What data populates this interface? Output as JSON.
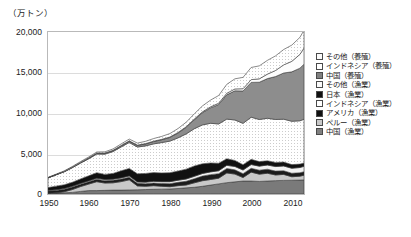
{
  "chart_data": {
    "type": "area",
    "title": "",
    "subtitle": "",
    "xlabel": "",
    "ylabel": "（万トン）",
    "unit_label": "（万トン）",
    "stacked": true,
    "grid": true,
    "legend_position": "right",
    "xlim": [
      1950,
      2013
    ],
    "ylim": [
      0,
      20000
    ],
    "yticks": [
      "0",
      "5,000",
      "10,000",
      "15,000",
      "20,000"
    ],
    "ytick_values": [
      0,
      5000,
      10000,
      15000,
      20000
    ],
    "xticks": [
      "1950",
      "1960",
      "1970",
      "1980",
      "1990",
      "2000",
      "2010"
    ],
    "xtick_values": [
      1950,
      1960,
      1970,
      1980,
      1990,
      2000,
      2010
    ],
    "x": [
      1950,
      1952,
      1954,
      1956,
      1958,
      1960,
      1962,
      1964,
      1966,
      1968,
      1970,
      1972,
      1974,
      1976,
      1978,
      1980,
      1982,
      1984,
      1986,
      1988,
      1990,
      1992,
      1994,
      1996,
      1998,
      2000,
      2002,
      2004,
      2006,
      2008,
      2010,
      2012,
      2013
    ],
    "series": [
      {
        "name": "中国（漁業）",
        "fill": "#7a7a7a",
        "pattern": "solid-gray",
        "values": [
          90,
          110,
          150,
          200,
          320,
          420,
          420,
          450,
          480,
          480,
          500,
          520,
          550,
          580,
          600,
          620,
          680,
          760,
          830,
          950,
          1100,
          1250,
          1400,
          1500,
          1600,
          1600,
          1550,
          1600,
          1650,
          1680,
          1700,
          1720,
          1740
        ]
      },
      {
        "name": "ペルー（漁業）",
        "fill": "#c9c9c9",
        "pattern": "light-gray",
        "values": [
          10,
          30,
          130,
          350,
          600,
          800,
          1100,
          900,
          900,
          1050,
          1250,
          480,
          400,
          450,
          350,
          280,
          350,
          350,
          550,
          690,
          690,
          700,
          1200,
          960,
          430,
          1100,
          900,
          960,
          700,
          740,
          430,
          480,
          580
        ]
      },
      {
        "name": "アメリカ（漁業）",
        "fill": "#1c1c1c",
        "pattern": "solid-black",
        "values": [
          290,
          300,
          310,
          310,
          290,
          290,
          310,
          300,
          310,
          310,
          320,
          320,
          320,
          330,
          350,
          380,
          410,
          460,
          500,
          570,
          600,
          560,
          550,
          520,
          480,
          470,
          490,
          500,
          480,
          450,
          430,
          420,
          430
        ]
      },
      {
        "name": "インドネシア（漁業）",
        "fill": "#f2f2f2",
        "pattern": "white",
        "values": [
          60,
          70,
          80,
          90,
          100,
          110,
          120,
          130,
          140,
          150,
          160,
          170,
          190,
          200,
          220,
          240,
          260,
          280,
          300,
          320,
          340,
          360,
          390,
          420,
          450,
          470,
          500,
          520,
          560,
          590,
          620,
          650,
          670
        ]
      },
      {
        "name": "日本（漁業）",
        "fill": "#111111",
        "pattern": "solid-black",
        "values": [
          340,
          460,
          470,
          500,
          550,
          620,
          680,
          640,
          710,
          870,
          930,
          1010,
          1080,
          1080,
          1080,
          1110,
          1130,
          1220,
          1280,
          1200,
          1100,
          930,
          810,
          740,
          660,
          640,
          560,
          520,
          510,
          480,
          450,
          420,
          410
        ]
      },
      {
        "name": "その他（漁業）",
        "fill": "#fbfbfb",
        "pattern": "dotted-light",
        "values": [
          1200,
          1400,
          1600,
          1800,
          1950,
          2100,
          2300,
          2500,
          2700,
          2950,
          3200,
          3300,
          3400,
          3550,
          3750,
          3900,
          4100,
          4350,
          4600,
          4800,
          4900,
          4850,
          4900,
          5000,
          5100,
          5200,
          5200,
          5250,
          5300,
          5300,
          5350,
          5350,
          5400
        ]
      },
      {
        "name": "中国（養殖）",
        "fill": "#8d8d8d",
        "pattern": "solid-gray",
        "values": [
          10,
          20,
          40,
          60,
          80,
          100,
          110,
          120,
          130,
          150,
          170,
          200,
          240,
          290,
          350,
          450,
          600,
          800,
          1100,
          1500,
          1900,
          2400,
          3000,
          3600,
          4000,
          4300,
          4600,
          4900,
          5300,
          5700,
          6100,
          6500,
          6800
        ]
      },
      {
        "name": "インドネシア（養殖）",
        "fill": "#fdfdfd",
        "pattern": "white",
        "values": [
          2,
          3,
          5,
          7,
          10,
          12,
          15,
          18,
          22,
          26,
          30,
          35,
          40,
          45,
          52,
          60,
          70,
          80,
          95,
          110,
          130,
          160,
          190,
          230,
          280,
          340,
          420,
          550,
          750,
          1000,
          1300,
          1700,
          2000
        ]
      },
      {
        "name": "その他（養殖）",
        "fill": "#f7f7f7",
        "pattern": "dotted-light",
        "values": [
          50,
          60,
          70,
          85,
          100,
          115,
          130,
          150,
          170,
          195,
          220,
          250,
          280,
          320,
          360,
          420,
          480,
          560,
          640,
          730,
          830,
          950,
          1100,
          1250,
          1400,
          1500,
          1600,
          1700,
          1800,
          1900,
          2000,
          2100,
          2200
        ]
      }
    ],
    "totals_note": "stacked total reaches about 19,500 by 2013"
  },
  "legend": {
    "items": [
      {
        "label": "その他（養殖）",
        "swatch": "dotted-light"
      },
      {
        "label": "インドネシア（養殖）",
        "swatch": "white"
      },
      {
        "label": "中国（養殖）",
        "swatch": "solid-gray"
      },
      {
        "label": "その他（漁業）",
        "swatch": "dotted-light"
      },
      {
        "label": "日本（漁業）",
        "swatch": "solid-black"
      },
      {
        "label": "インドネシア（漁業）",
        "swatch": "white"
      },
      {
        "label": "アメリカ（漁業）",
        "swatch": "solid-black"
      },
      {
        "label": "ペルー（漁業）",
        "swatch": "light-gray"
      },
      {
        "label": "中国（漁業）",
        "swatch": "solid-gray"
      }
    ]
  }
}
